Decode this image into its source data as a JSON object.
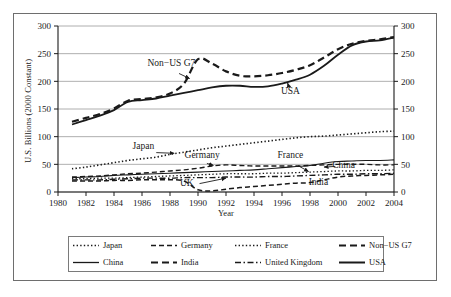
{
  "chart_data": {
    "type": "line",
    "title": "",
    "xlabel": "Year",
    "ylabel": "U.S. Billions (2000 Constant)",
    "ylabel_right": "U.S. Billions (2000 Constant)",
    "xlim": [
      1980,
      2004
    ],
    "ylim": [
      0,
      300
    ],
    "xticks": [
      1980,
      1982,
      1984,
      1986,
      1988,
      1990,
      1992,
      1994,
      1996,
      1998,
      2000,
      2002,
      2004
    ],
    "yticks": [
      0,
      50,
      100,
      150,
      200,
      250,
      300
    ],
    "yticks_right": [
      0,
      50,
      100,
      150,
      200,
      250,
      300
    ],
    "grid": "horizontal",
    "legend_position": "bottom",
    "x": [
      1981,
      1982,
      1983,
      1984,
      1985,
      1986,
      1987,
      1988,
      1989,
      1990,
      1991,
      1992,
      1993,
      1994,
      1995,
      1996,
      1997,
      1998,
      1999,
      2000,
      2001,
      2002,
      2003,
      2004
    ],
    "series": [
      {
        "name": "USA",
        "style": "solid",
        "width": 1.8,
        "values": [
          122,
          130,
          138,
          148,
          163,
          166,
          169,
          174,
          179,
          184,
          189,
          192,
          192,
          190,
          191,
          196,
          203,
          212,
          228,
          248,
          265,
          272,
          274,
          279
        ]
      },
      {
        "name": "Non-US G7",
        "style": "dashed",
        "width": 2.2,
        "values": [
          127,
          134,
          141,
          151,
          165,
          168,
          171,
          178,
          196,
          240,
          232,
          218,
          210,
          209,
          211,
          215,
          221,
          229,
          243,
          258,
          268,
          273,
          276,
          280
        ]
      },
      {
        "name": "Japan",
        "style": "dotted",
        "width": 1.6,
        "values": [
          42,
          45,
          49,
          53,
          57,
          60,
          63,
          68,
          72,
          76,
          80,
          83,
          86,
          89,
          92,
          95,
          98,
          100,
          101,
          103,
          105,
          107,
          109,
          110
        ]
      },
      {
        "name": "Germany",
        "style": "dashed",
        "width": 1.4,
        "values": [
          27,
          28,
          29,
          31,
          33,
          34,
          36,
          38,
          40,
          43,
          47,
          49,
          48,
          47,
          47,
          47,
          47,
          48,
          49,
          50,
          50,
          50,
          49,
          49
        ]
      },
      {
        "name": "France",
        "style": "dotted",
        "width": 1.3,
        "values": [
          24,
          24,
          25,
          25,
          26,
          27,
          28,
          29,
          30,
          31,
          32,
          33,
          33,
          33,
          34,
          34,
          35,
          36,
          37,
          38,
          38,
          39,
          39,
          40
        ]
      },
      {
        "name": "United Kingdom",
        "style": "dashdot",
        "width": 1.4,
        "values": [
          22,
          22,
          22,
          23,
          24,
          25,
          25,
          25,
          26,
          26,
          26,
          27,
          27,
          27,
          28,
          28,
          29,
          30,
          31,
          32,
          32,
          33,
          33,
          34
        ]
      },
      {
        "name": "China",
        "style": "solid",
        "width": 1.1,
        "values": [
          26,
          27,
          28,
          30,
          31,
          32,
          33,
          34,
          35,
          36,
          37,
          38,
          39,
          40,
          42,
          44,
          46,
          48,
          52,
          55,
          56,
          57,
          57,
          58
        ]
      },
      {
        "name": "India",
        "style": "dashed",
        "width": 1.5,
        "values": [
          20,
          20,
          20,
          21,
          21,
          22,
          22,
          22,
          20,
          4,
          2,
          5,
          8,
          10,
          12,
          14,
          16,
          17,
          22,
          27,
          29,
          30,
          31,
          32
        ]
      }
    ],
    "annotations": [
      {
        "text": "Non−US G7",
        "x": 1988.1,
        "y": 228,
        "arrow_to_x": 1989.4,
        "arrow_to_y": 205
      },
      {
        "text": "USA",
        "x": 1996.6,
        "y": 178,
        "arrow_to_x": 1996.4,
        "arrow_to_y": 197
      },
      {
        "text": "Japan",
        "x": 1986.1,
        "y": 78,
        "arrow_to_x": 1988.3,
        "arrow_to_y": 70
      },
      {
        "text": "Germany",
        "x": 1990.3,
        "y": 62,
        "arrow_to_x": 1991.1,
        "arrow_to_y": 48
      },
      {
        "text": "France",
        "x": 1996.6,
        "y": 62,
        "arrow_to_x": 1997.9,
        "arrow_to_y": 37
      },
      {
        "text": "China",
        "x": 2000.4,
        "y": 44,
        "arrow_to_x": 1999.0,
        "arrow_to_y": 45
      },
      {
        "text": "India",
        "x": 1998.6,
        "y": 13,
        "arrow_to_x": 1998.6,
        "arrow_to_y": 13
      },
      {
        "text": "UK",
        "x": 1989.2,
        "y": 10,
        "arrow_to_x": 1992.0,
        "arrow_to_y": 25
      }
    ]
  },
  "legend": {
    "items": [
      {
        "label": "Japan",
        "style": "dotted"
      },
      {
        "label": "Germany",
        "style": "dashed"
      },
      {
        "label": "France",
        "style": "dotted"
      },
      {
        "label": "Non−US G7",
        "style": "dashed"
      },
      {
        "label": "China",
        "style": "solid"
      },
      {
        "label": "India",
        "style": "dashed"
      },
      {
        "label": "United Kingdom",
        "style": "dashdot"
      },
      {
        "label": "USA",
        "style": "solid"
      }
    ]
  },
  "colors": {
    "ink": "#1a1a1a",
    "grid": "#9a9a9a",
    "frame": "#6e6e6e",
    "background": "#ffffff"
  }
}
